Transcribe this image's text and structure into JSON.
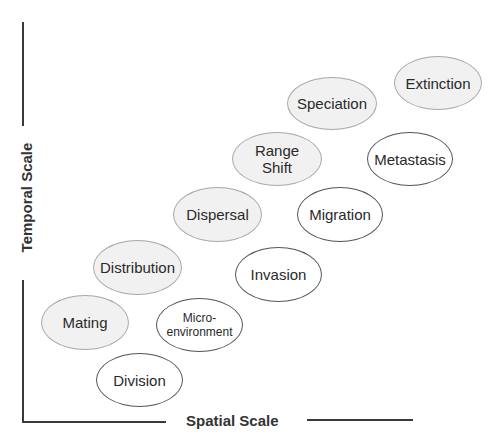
{
  "axes": {
    "x_label": "Spatial Scale",
    "y_label": "Temporal Scale"
  },
  "colors": {
    "ecology_fill": "#f1f1f1",
    "ecology_border": "#a8a8a8",
    "cancer_fill": "#ffffff",
    "cancer_border": "#555555",
    "axis": "#3a3a3a"
  },
  "nodes": {
    "extinction": {
      "label": "Extinction",
      "group": "ecology"
    },
    "speciation": {
      "label": "Speciation",
      "group": "ecology"
    },
    "range_shift": {
      "label": "Range Shift",
      "line1": "Range",
      "line2": "Shift",
      "group": "ecology"
    },
    "metastasis": {
      "label": "Metastasis",
      "group": "cancer"
    },
    "dispersal": {
      "label": "Dispersal",
      "group": "ecology"
    },
    "migration": {
      "label": "Migration",
      "group": "cancer"
    },
    "distribution": {
      "label": "Distribution",
      "group": "ecology"
    },
    "invasion": {
      "label": "Invasion",
      "group": "cancer"
    },
    "mating": {
      "label": "Mating",
      "group": "ecology"
    },
    "microenvironment": {
      "label": "Micro-environment",
      "line1": "Micro-",
      "line2": "environment",
      "group": "cancer"
    },
    "division": {
      "label": "Division",
      "group": "cancer"
    }
  }
}
